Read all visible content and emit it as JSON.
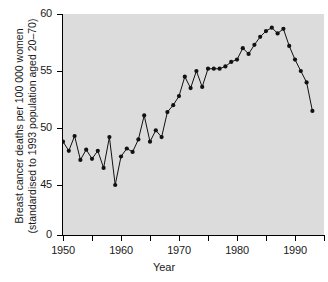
{
  "chart_data": {
    "type": "line",
    "title": "",
    "xlabel": "Year",
    "ylabel": "Breast cancer deaths per 100 000 women (standardised to 1993 population aged 20–70)",
    "ylabel_line1": "Breast cancer deaths per 100 000 women",
    "ylabel_line2": "(standardised to 1993 population aged 20–70)",
    "xlim": [
      1949,
      1995
    ],
    "ylim": [
      45,
      60
    ],
    "y_axis_break_at_zero": true,
    "grid": false,
    "legend": null,
    "marker": "filled-circle",
    "y_tick_labels": [
      "0",
      "45",
      "50",
      "55",
      "60"
    ],
    "y_tick_values": [
      0,
      45,
      50,
      55,
      60
    ],
    "x_tick_labels": [
      "1950",
      "1960",
      "1970",
      "1980",
      "1990"
    ],
    "x_tick_values": [
      1950,
      1960,
      1970,
      1980,
      1990
    ],
    "x_minor_ticks": [
      1955,
      1965,
      1975,
      1985,
      1995
    ],
    "x": [
      1950,
      1951,
      1952,
      1953,
      1954,
      1955,
      1956,
      1957,
      1958,
      1959,
      1960,
      1961,
      1962,
      1963,
      1964,
      1965,
      1966,
      1967,
      1968,
      1969,
      1970,
      1971,
      1972,
      1973,
      1974,
      1975,
      1976,
      1977,
      1978,
      1979,
      1980,
      1981,
      1982,
      1983,
      1984,
      1985,
      1986,
      1987,
      1988,
      1989,
      1990,
      1991,
      1992,
      1993
    ],
    "values": [
      48.8,
      48.0,
      49.3,
      47.2,
      48.1,
      47.3,
      48.0,
      46.5,
      49.2,
      45.0,
      47.5,
      48.2,
      47.9,
      49.0,
      51.1,
      48.8,
      49.8,
      49.2,
      51.4,
      52.0,
      52.8,
      54.5,
      53.5,
      55.0,
      53.6,
      55.2,
      55.2,
      55.2,
      55.4,
      55.8,
      56.0,
      57.0,
      56.5,
      57.3,
      58.0,
      58.5,
      58.8,
      58.3,
      58.7,
      57.2,
      56.0,
      55.0,
      54.0,
      51.5
    ],
    "colors": {
      "panel_background": "#dcdcdc",
      "line": "#111111",
      "marker": "#111111",
      "axis": "#000000",
      "text": "#1a1a1a",
      "figure_background": "#ffffff"
    }
  }
}
